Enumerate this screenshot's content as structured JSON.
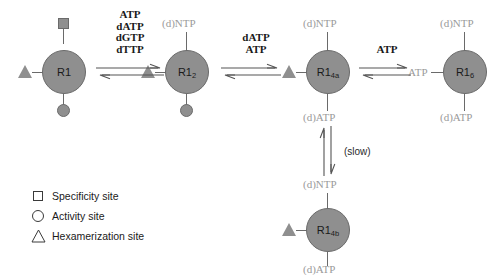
{
  "diagram": {
    "colors": {
      "node_fill": "#8f8f8f",
      "node_stroke": "#6a6a6a",
      "ligand_text": "#9a9a9a",
      "reaction_text": "#1a1a1a",
      "background": "#ffffff"
    }
  },
  "nodes": [
    {
      "id": "R1",
      "label": "R1",
      "subscript": "",
      "top_site": "specificity-square",
      "left_site": "hexamerization-triangle",
      "bottom_site": "activity-circle",
      "top_ligand": "",
      "bottom_ligand": "",
      "left_ligand": ""
    },
    {
      "id": "R1_2",
      "label": "R1",
      "subscript": "2",
      "top_site": "ligand-label",
      "left_site": "hexamerization-triangle",
      "bottom_site": "activity-circle",
      "top_ligand": "(d)NTP",
      "bottom_ligand": "",
      "left_ligand": ""
    },
    {
      "id": "R1_4a",
      "label": "R1",
      "subscript": "4a",
      "top_site": "ligand-label",
      "left_site": "hexamerization-triangle",
      "bottom_site": "ligand-label",
      "top_ligand": "(d)NTP",
      "bottom_ligand": "(d)ATP",
      "left_ligand": ""
    },
    {
      "id": "R1_6",
      "label": "R1",
      "subscript": "6",
      "top_site": "ligand-label",
      "left_site": "ligand-label",
      "bottom_site": "ligand-label",
      "top_ligand": "(d)NTP",
      "bottom_ligand": "(d)ATP",
      "left_ligand": "ATP"
    },
    {
      "id": "R1_4b",
      "label": "R1",
      "subscript": "4b",
      "top_site": "ligand-label",
      "left_site": "hexamerization-triangle",
      "bottom_site": "ligand-label",
      "top_ligand": "(d)NTP",
      "bottom_ligand": "(d)ATP",
      "left_ligand": ""
    }
  ],
  "reactions": [
    {
      "id": "rxn-1",
      "from": "R1",
      "to": "R1_2",
      "orientation": "horizontal",
      "lines": [
        "ATP",
        "dATP",
        "dGTP",
        "dTTP"
      ]
    },
    {
      "id": "rxn-2",
      "from": "R1_2",
      "to": "R1_4a",
      "orientation": "horizontal",
      "lines": [
        "dATP",
        "ATP"
      ]
    },
    {
      "id": "rxn-3",
      "from": "R1_4a",
      "to": "R1_6",
      "orientation": "horizontal",
      "lines": [
        "ATP"
      ]
    },
    {
      "id": "rxn-4",
      "from": "R1_4a",
      "to": "R1_4b",
      "orientation": "vertical",
      "lines": [
        "(slow)"
      ]
    }
  ],
  "legend": {
    "items": [
      {
        "glyph": "square",
        "label": "Specificity site"
      },
      {
        "glyph": "circle",
        "label": "Activity site"
      },
      {
        "glyph": "triangle",
        "label": "Hexamerization site"
      }
    ]
  }
}
